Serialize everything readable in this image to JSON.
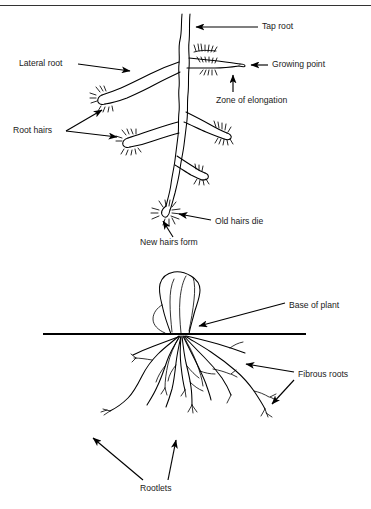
{
  "page": {
    "background_color": "#ffffff",
    "ink_color": "#000000",
    "width": 371,
    "height": 509,
    "top_rule": true
  },
  "figures": [
    {
      "id": "taproot-system",
      "name": "Tap root system",
      "labels": [
        {
          "key": "tap_root",
          "text": "Tap root",
          "x": 262,
          "y": 27,
          "anchor": "start",
          "leader": "horizontal-left-arrow"
        },
        {
          "key": "growing_point",
          "text": "Growing point",
          "x": 272,
          "y": 65,
          "anchor": "start",
          "leader": "short-left-arrow"
        },
        {
          "key": "zone_of_elongation",
          "text": "Zone of elongation",
          "x": 216,
          "y": 101,
          "anchor": "start",
          "leader": "vertical-up-arrow"
        },
        {
          "key": "lateral_root",
          "text": "Lateral root",
          "x": 19,
          "y": 64,
          "anchor": "start",
          "leader": "diagonal-right-arrow"
        },
        {
          "key": "root_hairs",
          "text": "Root hairs",
          "x": 13,
          "y": 131,
          "anchor": "start",
          "leader": "two-branch-arrows"
        },
        {
          "key": "old_hairs_die",
          "text": "Old hairs die",
          "x": 215,
          "y": 222,
          "anchor": "start",
          "leader": "horizontal-left-arrow"
        },
        {
          "key": "new_hairs_form",
          "text": "New hairs form",
          "x": 140,
          "y": 243,
          "anchor": "start",
          "leader": "diagonal-up-arrow"
        }
      ]
    },
    {
      "id": "fibrous-root-system",
      "name": "Fibrous root system",
      "soil_line": {
        "x1": 43,
        "x2": 306,
        "y": 334
      },
      "labels": [
        {
          "key": "base_of_plant",
          "text": "Base of plant",
          "x": 289,
          "y": 306,
          "anchor": "start",
          "leader": "diagonal-left-arrow"
        },
        {
          "key": "fibrous_roots",
          "text": "Fibrous roots",
          "x": 298,
          "y": 375,
          "anchor": "start",
          "leader": "two-branch-arrows"
        },
        {
          "key": "rootlets",
          "text": "Rootlets",
          "x": 140,
          "y": 489,
          "anchor": "start",
          "leader": "two-up-arrows"
        }
      ]
    }
  ]
}
